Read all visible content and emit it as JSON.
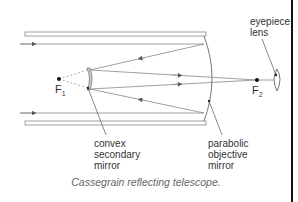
{
  "diagram": {
    "title": "Cassegrain reflecting telescope",
    "caption": "Cassegrain reflecting telescope.",
    "labels": {
      "eyepiece": [
        "eyepiece",
        "lens"
      ],
      "secondary": [
        "convex",
        "secondary",
        "mirror"
      ],
      "primary": [
        "parabolic",
        "objective",
        "mirror"
      ],
      "f1": "F",
      "f1_sub": "1",
      "f2": "F",
      "f2_sub": "2"
    },
    "colors": {
      "line": "#777777",
      "tube": "#888888",
      "border": "#111111",
      "text": "#333333"
    }
  }
}
